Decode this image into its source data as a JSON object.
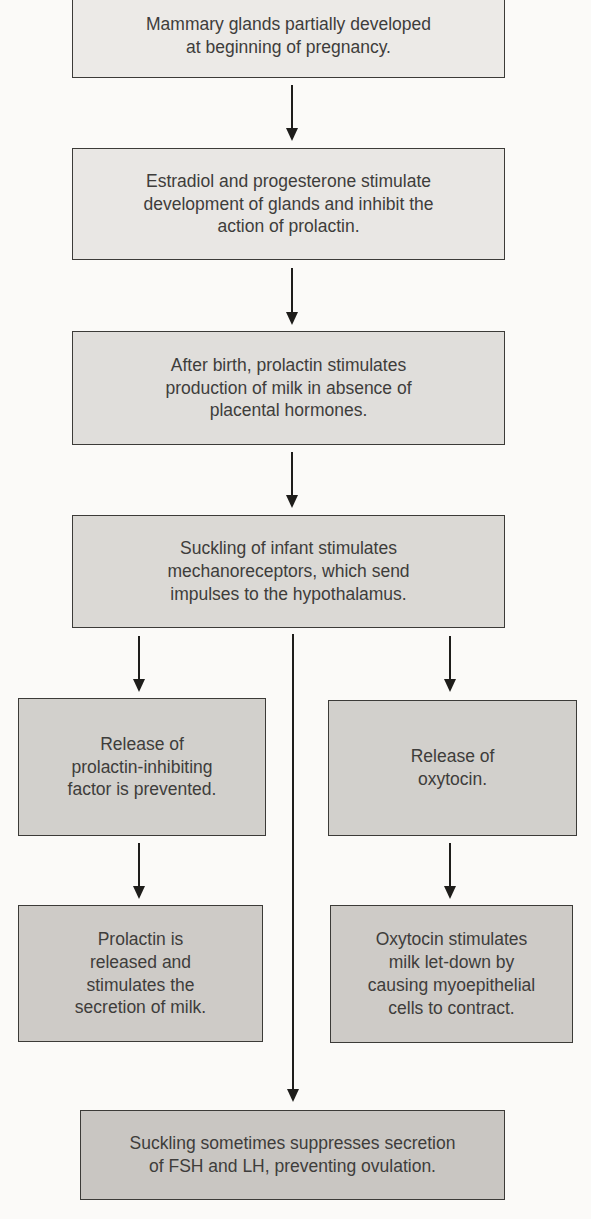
{
  "diagram": {
    "type": "flowchart",
    "topic": "Hormonal control of lactation",
    "background_color": "#fbfaf8",
    "border_color": "#3c3b38",
    "text_color": "#3e3d3b",
    "arrow_color": "#1e1d1b",
    "boxes": [
      {
        "id": "mammary-glands",
        "fill": "#eceae7",
        "lines": [
          "Mammary glands partially developed",
          "at beginning of pregnancy."
        ]
      },
      {
        "id": "estradiol-progesterone",
        "fill": "#e9e7e4",
        "lines": [
          "Estradiol and progesterone stimulate",
          "development of glands and inhibit the",
          "action of prolactin."
        ]
      },
      {
        "id": "after-birth-prolactin",
        "fill": "#e0dedb",
        "lines": [
          "After birth, prolactin stimulates",
          "production of milk in absence of",
          "placental hormones."
        ]
      },
      {
        "id": "suckling-mechanoreceptors",
        "fill": "#dbd9d5",
        "lines": [
          "Suckling of infant stimulates",
          "mechanoreceptors, which send",
          "impulses to the hypothalamus."
        ]
      },
      {
        "id": "pif-prevented",
        "fill": "#d2d0cc",
        "lines": [
          "Release of",
          "prolactin-inhibiting",
          "factor is prevented."
        ]
      },
      {
        "id": "oxytocin-release",
        "fill": "#d2d0cc",
        "lines": [
          "Release of",
          "oxytocin."
        ]
      },
      {
        "id": "prolactin-released",
        "fill": "#cecbc7",
        "lines": [
          "Prolactin is",
          "released and",
          "stimulates the",
          "secretion of milk."
        ]
      },
      {
        "id": "oxytocin-letdown",
        "fill": "#cecbc7",
        "lines": [
          "Oxytocin stimulates",
          "milk let-down by",
          "causing myoepithelial",
          "cells to contract."
        ]
      },
      {
        "id": "fsh-lh-suppression",
        "fill": "#c9c6c2",
        "lines": [
          "Suckling sometimes suppresses secretion",
          "of FSH and LH, preventing ovulation."
        ]
      }
    ],
    "arrows": [
      {
        "id": "arrow-1",
        "from": "mammary-glands",
        "to": "estradiol-progesterone"
      },
      {
        "id": "arrow-2",
        "from": "estradiol-progesterone",
        "to": "after-birth-prolactin"
      },
      {
        "id": "arrow-3",
        "from": "after-birth-prolactin",
        "to": "suckling-mechanoreceptors"
      },
      {
        "id": "arrow-left-1",
        "from": "suckling-mechanoreceptors",
        "to": "pif-prevented"
      },
      {
        "id": "arrow-right-1",
        "from": "suckling-mechanoreceptors",
        "to": "oxytocin-release"
      },
      {
        "id": "arrow-left-2",
        "from": "pif-prevented",
        "to": "prolactin-released"
      },
      {
        "id": "arrow-right-2",
        "from": "oxytocin-release",
        "to": "oxytocin-letdown"
      },
      {
        "id": "arrow-center-long",
        "from": "suckling-mechanoreceptors",
        "to": "fsh-lh-suppression"
      }
    ]
  }
}
